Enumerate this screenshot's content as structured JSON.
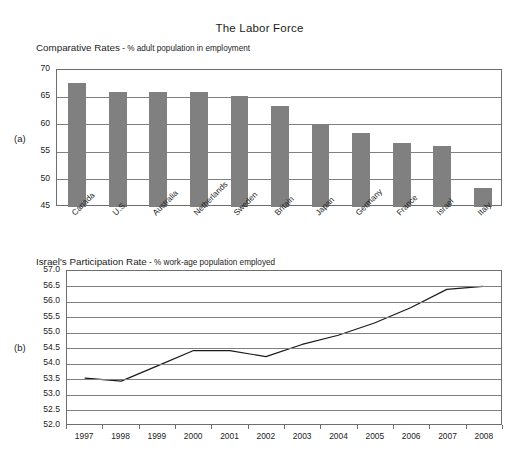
{
  "figure": {
    "title": "The Labor Force",
    "panel_a_label": "(a)",
    "panel_b_label": "(b)"
  },
  "chart_data": [
    {
      "type": "bar",
      "panel": "(a)",
      "title": "Comparative Rates",
      "title_strong": "Comparative Rates",
      "title_light": " - % adult population in employment",
      "xlabel": "",
      "ylabel": "",
      "ylim": [
        45,
        70
      ],
      "yticks": [
        45,
        50,
        55,
        60,
        65,
        70
      ],
      "ytick_labels": [
        "45",
        "50",
        "55",
        "60",
        "65",
        "70"
      ],
      "grid": true,
      "legend": "none",
      "bar_color": "#808080",
      "categories": [
        "Canada",
        "U.S.",
        "Australia",
        "Netherlands",
        "Sweden",
        "Britain",
        "Japan",
        "Germany",
        "France",
        "Israel",
        "Italy"
      ],
      "values": [
        67.6,
        66.0,
        66.0,
        66.0,
        65.3,
        63.4,
        59.9,
        58.5,
        56.7,
        56.2,
        48.5
      ]
    },
    {
      "type": "line",
      "panel": "(b)",
      "title": "Israel's Participation Rate",
      "title_strong": "Israel's Participation Rate",
      "title_light": " - % work-age population employed",
      "xlabel": "",
      "ylabel": "",
      "ylim": [
        52.0,
        57.0
      ],
      "yticks": [
        52.0,
        52.5,
        53.0,
        53.5,
        54.0,
        54.5,
        55.0,
        55.5,
        56.0,
        56.5,
        57.0
      ],
      "ytick_labels": [
        "52.0",
        "52.5",
        "53.0",
        "53.5",
        "54.0",
        "54.5",
        "55.0",
        "55.5",
        "56.0",
        "56.5",
        "57.0"
      ],
      "grid": true,
      "legend": "none",
      "line_color": "#1a1a1a",
      "x": [
        "1997",
        "1998",
        "1999",
        "2000",
        "2001",
        "2002",
        "2003",
        "2004",
        "2005",
        "2006",
        "2007",
        "2008"
      ],
      "values": [
        53.5,
        53.4,
        53.9,
        54.4,
        54.4,
        54.2,
        54.6,
        54.9,
        55.3,
        55.8,
        56.4,
        56.5
      ]
    }
  ]
}
